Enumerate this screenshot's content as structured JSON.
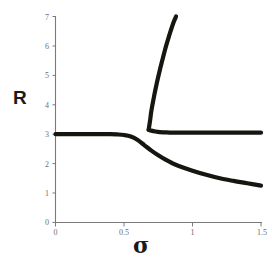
{
  "chart_data": {
    "type": "line",
    "title": "",
    "subtitle": "",
    "xlabel": "σ",
    "ylabel": "R",
    "xlim": [
      0,
      1.5
    ],
    "ylim": [
      0,
      7
    ],
    "xticks": [
      0,
      0.5,
      1,
      1.5
    ],
    "xtick_labels": [
      "0",
      "0.5",
      "1",
      "1.5"
    ],
    "yticks": [
      0,
      1,
      2,
      3,
      4,
      5,
      6,
      7
    ],
    "ytick_labels": [
      "0",
      "1",
      "2",
      "3",
      "4",
      "5",
      "6",
      "7"
    ],
    "grid": false,
    "legend": false,
    "legend_position": "none",
    "line_color": "#17150f",
    "axis_color": "#7a7a7a",
    "background_color": "#ffffff",
    "annotations": [],
    "series": [
      {
        "name": "lower-branch",
        "description": "Flat at R=3 from sigma=0, bends down near sigma=0.58 and decays toward R=1.25 at sigma=1.5",
        "x": [
          0.0,
          0.1,
          0.2,
          0.3,
          0.4,
          0.45,
          0.5,
          0.55,
          0.6,
          0.65,
          0.7,
          0.75,
          0.8,
          0.85,
          0.9,
          1.0,
          1.1,
          1.2,
          1.3,
          1.4,
          1.5
        ],
        "y": [
          3.0,
          3.0,
          3.0,
          3.0,
          3.0,
          2.99,
          2.97,
          2.92,
          2.8,
          2.62,
          2.44,
          2.28,
          2.14,
          2.02,
          1.92,
          1.76,
          1.62,
          1.5,
          1.41,
          1.33,
          1.25
        ]
      },
      {
        "name": "upper-branch-rising",
        "description": "Steep branch emerging from the knee near sigma=0.68, R=3.15 and rising off the top of the plot at R=7 near sigma=0.88",
        "x": [
          0.68,
          0.69,
          0.7,
          0.72,
          0.74,
          0.76,
          0.78,
          0.8,
          0.82,
          0.84,
          0.86,
          0.88
        ],
        "y": [
          3.15,
          3.45,
          3.8,
          4.3,
          4.75,
          5.15,
          5.52,
          5.88,
          6.2,
          6.5,
          6.78,
          7.0
        ]
      },
      {
        "name": "upper-branch-flat",
        "description": "Branch leaving the knee near sigma=0.68 and flattening to R=3.05 out to sigma=1.5",
        "x": [
          0.68,
          0.7,
          0.73,
          0.76,
          0.8,
          0.85,
          0.9,
          1.0,
          1.1,
          1.2,
          1.3,
          1.4,
          1.5
        ],
        "y": [
          3.15,
          3.12,
          3.09,
          3.07,
          3.06,
          3.05,
          3.05,
          3.05,
          3.05,
          3.05,
          3.05,
          3.05,
          3.05
        ]
      }
    ]
  },
  "figure": {
    "axis_label_y": "R",
    "axis_label_x": "σ"
  }
}
